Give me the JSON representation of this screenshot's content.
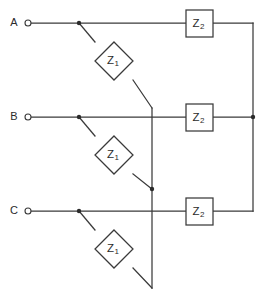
{
  "diagram": {
    "background_color": "#ffffff",
    "line_color": "#3a3a3a",
    "text_color": "#2b2b2b"
  },
  "terminals": [
    {
      "id": "A",
      "label": "A",
      "label_x": 14,
      "label_y": 23,
      "ring_cx": 28,
      "ring_cy": 23,
      "ring_r": 3,
      "line_y": 23
    },
    {
      "id": "B",
      "label": "B",
      "label_x": 14,
      "label_y": 117,
      "ring_cx": 28,
      "ring_cy": 117,
      "ring_r": 3,
      "line_y": 117
    },
    {
      "id": "C",
      "label": "C",
      "label_x": 14,
      "label_y": 211,
      "ring_cx": 28,
      "ring_cy": 211,
      "ring_r": 3,
      "line_y": 211
    }
  ],
  "series_impedances": [
    {
      "id": "z1-a",
      "symbol": "Z",
      "subscript": "1",
      "shape": "diamond",
      "cx": 114,
      "cy": 61,
      "half_w": 19,
      "half_h": 19
    },
    {
      "id": "z1-b",
      "symbol": "Z",
      "subscript": "1",
      "shape": "diamond",
      "cx": 114,
      "cy": 155,
      "half_w": 19,
      "half_h": 19
    },
    {
      "id": "z1-c",
      "symbol": "Z",
      "subscript": "1",
      "shape": "diamond",
      "cx": 114,
      "cy": 249,
      "half_w": 19,
      "half_h": 19
    }
  ],
  "shunt_impedances": [
    {
      "id": "z2-a",
      "symbol": "Z",
      "subscript": "2",
      "shape": "box",
      "x": 186,
      "y": 10,
      "w": 27,
      "h": 27
    },
    {
      "id": "z2-b",
      "symbol": "Z",
      "subscript": "2",
      "shape": "box",
      "x": 186,
      "y": 104,
      "w": 27,
      "h": 27
    },
    {
      "id": "z2-c",
      "symbol": "Z",
      "subscript": "2",
      "shape": "box",
      "x": 186,
      "y": 198,
      "w": 27,
      "h": 27
    }
  ],
  "junction_dots": [
    {
      "id": "tap-a",
      "cx": 79,
      "cy": 23,
      "r": 2.2
    },
    {
      "id": "tap-b",
      "cx": 79,
      "cy": 117,
      "r": 2.2
    },
    {
      "id": "tap-c",
      "cx": 79,
      "cy": 211,
      "r": 2.2
    },
    {
      "id": "star-mid",
      "cx": 152,
      "cy": 189,
      "r": 2.2
    },
    {
      "id": "bus-b",
      "cx": 253,
      "cy": 117,
      "r": 2.2
    }
  ],
  "wires": {
    "horizontal_a": {
      "x1": 31,
      "y1": 23,
      "x2": 186,
      "y2": 23
    },
    "horizontal_b": {
      "x1": 31,
      "y1": 117,
      "x2": 186,
      "y2": 117
    },
    "horizontal_c": {
      "x1": 31,
      "y1": 211,
      "x2": 186,
      "y2": 211
    },
    "z2a_out": {
      "x1": 213,
      "y1": 23,
      "x2": 253,
      "y2": 23
    },
    "z2b_out": {
      "x1": 213,
      "y1": 117,
      "x2": 253,
      "y2": 117
    },
    "z2c_out": {
      "x1": 213,
      "y1": 211,
      "x2": 253,
      "y2": 211
    },
    "right_bus": {
      "x1": 253,
      "y1": 23,
      "x2": 253,
      "y2": 211
    },
    "star_vertical": {
      "x1": 152,
      "y1": 108,
      "x2": 152,
      "y2": 288
    },
    "diag_a_upper": {
      "x1": 79,
      "y1": 23,
      "x2": 95,
      "y2": 42
    },
    "diag_a_lower": {
      "x1": 133,
      "y1": 80,
      "x2": 152,
      "y2": 108
    },
    "diag_b_upper": {
      "x1": 79,
      "y1": 117,
      "x2": 95,
      "y2": 136
    },
    "diag_b_lower": {
      "x1": 133,
      "y1": 174,
      "x2": 152,
      "y2": 189
    },
    "diag_c_upper": {
      "x1": 79,
      "y1": 211,
      "x2": 95,
      "y2": 230
    },
    "diag_c_lower": {
      "x1": 133,
      "y1": 268,
      "x2": 152,
      "y2": 288
    }
  }
}
